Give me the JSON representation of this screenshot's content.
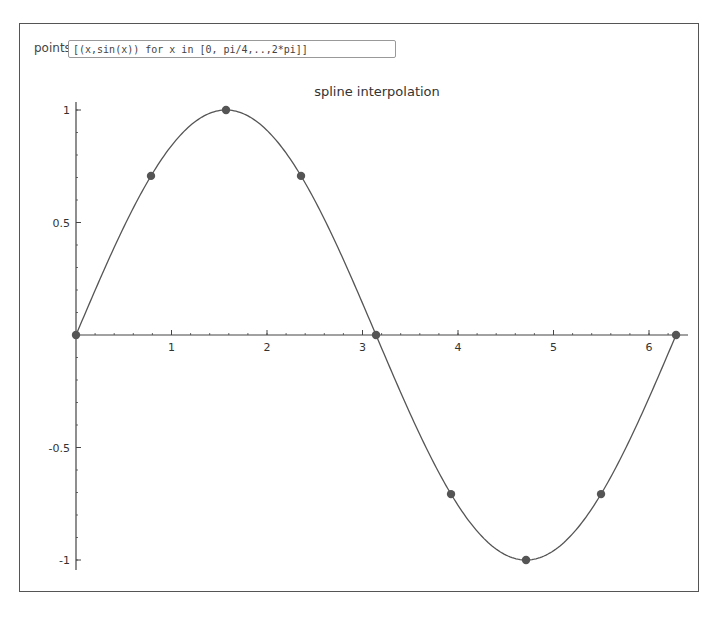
{
  "controls": {
    "points_label": "points",
    "points_value": "[(x,sin(x)) for x in [0, pi/4,..,2*pi]]"
  },
  "chart_data": {
    "type": "line",
    "title": "spline interpolation",
    "xlabel": "",
    "ylabel": "",
    "xlim": [
      0,
      6.4
    ],
    "ylim": [
      -1.05,
      1.05
    ],
    "grid": false,
    "x_ticks": [
      1,
      2,
      3,
      4,
      5,
      6
    ],
    "y_ticks": [
      1,
      0.5,
      -0.5,
      -1
    ],
    "y_tick_labels": [
      "1",
      "0.5",
      "-0.5",
      "-1"
    ],
    "series": [
      {
        "name": "spline",
        "style": "curve",
        "x": [
          0,
          0.7854,
          1.5708,
          2.3562,
          3.1416,
          3.927,
          4.7124,
          5.4978,
          6.2832
        ],
        "values": [
          0,
          0.7071,
          1,
          0.7071,
          0,
          -0.7071,
          -1,
          -0.7071,
          0
        ]
      },
      {
        "name": "points",
        "style": "markers",
        "x": [
          0,
          0.7854,
          1.5708,
          2.3562,
          3.1416,
          3.927,
          4.7124,
          5.4978,
          6.2832
        ],
        "values": [
          0,
          0.7071,
          1,
          0.7071,
          0,
          -0.7071,
          -1,
          -0.7071,
          0
        ]
      }
    ],
    "colors": {
      "line": "#555555",
      "marker": "#555555",
      "axis": "#444444"
    }
  }
}
